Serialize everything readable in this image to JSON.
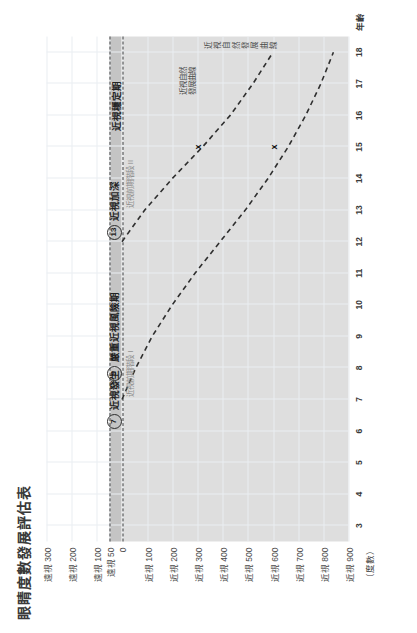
{
  "chart": {
    "title": "眼睛度數發展評估表",
    "unit_label": "（度數）",
    "x_axis_title": "年齡",
    "x_ticks": [
      "3",
      "4",
      "5",
      "6",
      "7",
      "8",
      "9",
      "10",
      "11",
      "12",
      "13",
      "14",
      "15",
      "16",
      "17",
      "18"
    ],
    "y_ticks": [
      "遠視 300",
      "遠視 200",
      "遠視 100",
      "遠視 50",
      "0",
      "近視 100",
      "近視 200",
      "近視 300",
      "近視 400",
      "近視 500",
      "近視 600",
      "近視 700",
      "近視 800",
      "近視 900"
    ]
  },
  "chart_data": {
    "type": "line",
    "title": "眼睛度數發展評估表",
    "xlabel": "年齡",
    "ylabel": "（度數）",
    "xlim": [
      2.5,
      18.5
    ],
    "ylim": [
      -900,
      300
    ],
    "grid": true,
    "legend_position": "inline-callout",
    "y_tick_values": [
      300,
      200,
      100,
      50,
      0,
      -100,
      -200,
      -300,
      -400,
      -500,
      -600,
      -700,
      -800,
      -900
    ],
    "y_tick_labels": [
      "遠視 300",
      "遠視 200",
      "遠視 100",
      "遠視 50",
      "0",
      "近視 100",
      "近視 200",
      "近視 300",
      "近視 400",
      "近視 500",
      "近視 600",
      "近視 700",
      "近視 800",
      "近視 900"
    ],
    "x_tick_values": [
      3,
      4,
      5,
      6,
      7,
      8,
      9,
      10,
      11,
      12,
      13,
      14,
      15,
      16,
      17,
      18
    ],
    "bands": [
      {
        "name": "遠視 0~50 帶",
        "from": 0,
        "to": 50,
        "color": "#c4c4c4"
      },
      {
        "name": "近視區",
        "from": -900,
        "to": 0,
        "color": "#dcdcdc"
      }
    ],
    "reference_lines": [
      {
        "name": "遠視 50 虛線",
        "y": 50,
        "style": "dashed"
      },
      {
        "name": "0 度虛線",
        "y": 0,
        "style": "dashed"
      }
    ],
    "series": [
      {
        "name": "近視自然發展曲線（早發）",
        "style": "dashed",
        "x": [
          7,
          8,
          9,
          10,
          11,
          12,
          13,
          14,
          15,
          16,
          17,
          18
        ],
        "values": [
          0,
          -55,
          -120,
          -200,
          -290,
          -390,
          -490,
          -580,
          -660,
          -730,
          -790,
          -840
        ]
      },
      {
        "name": "近視自然發展曲線（晚發）",
        "style": "dashed",
        "x": [
          12,
          13,
          14,
          15,
          16,
          17,
          18
        ],
        "values": [
          0,
          -90,
          -200,
          -320,
          -430,
          -520,
          -600
        ]
      }
    ],
    "markers": [
      {
        "label": "x",
        "x": 15,
        "y": -300
      },
      {
        "label": "x",
        "x": 15,
        "y": -600
      }
    ],
    "annotations": [
      {
        "badge": "7",
        "text": "近視發生",
        "sub": "近視前期階段 I",
        "x": 7,
        "y": 30
      },
      {
        "badge": "9",
        "text": "嚴重近視風險期",
        "sub": "",
        "x": 9,
        "y": 30
      },
      {
        "badge": "13",
        "text": "近視加深",
        "sub": "近視前期階段 II",
        "x": 13,
        "y": 30
      },
      {
        "text": "近視穩定期",
        "x": 16.3,
        "y": 25
      },
      {
        "text": "近視自然\n發展曲線",
        "x": 17.1,
        "y": -300
      },
      {
        "text": "近視自然\n發展曲線",
        "x": 18.2,
        "y": -620
      }
    ]
  }
}
